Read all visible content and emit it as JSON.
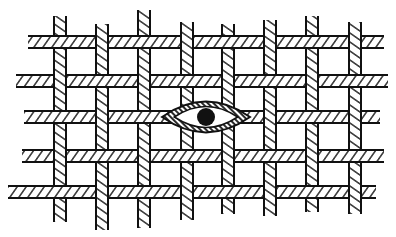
{
  "diagram": {
    "title": "",
    "colors": {
      "ink": "#111111",
      "paper": "#ffffff"
    },
    "strip_width": 12,
    "horizontal_strips": [
      {
        "y": 42,
        "x1": 28,
        "x2": 384
      },
      {
        "y": 81,
        "x1": 16,
        "x2": 388
      },
      {
        "y": 117,
        "x1": 24,
        "x2": 380
      },
      {
        "y": 156,
        "x1": 22,
        "x2": 384
      },
      {
        "y": 192,
        "x1": 8,
        "x2": 376
      }
    ],
    "vertical_strips": [
      {
        "x": 60,
        "y1": 16,
        "y2": 222
      },
      {
        "x": 102,
        "y1": 24,
        "y2": 230
      },
      {
        "x": 144,
        "y1": 10,
        "y2": 228
      },
      {
        "x": 187,
        "y1": 22,
        "y2": 220
      },
      {
        "x": 228,
        "y1": 24,
        "y2": 214
      },
      {
        "x": 270,
        "y1": 20,
        "y2": 216
      },
      {
        "x": 312,
        "y1": 16,
        "y2": 212
      },
      {
        "x": 355,
        "y1": 22,
        "y2": 214
      }
    ],
    "eye": {
      "cx": 206,
      "cy": 117,
      "rx": 44,
      "ry": 14,
      "pupil_r": 9
    }
  }
}
